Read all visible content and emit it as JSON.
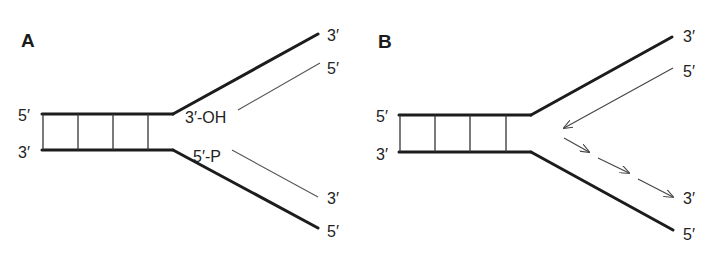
{
  "figure": {
    "panel_a": {
      "label": "A",
      "duplex_left_top": "5′",
      "duplex_left_bottom": "3′",
      "upper_parental_end": "3′",
      "upper_daughter_end": "5′",
      "lower_daughter_end": "3′",
      "lower_parental_end": "5′",
      "upper_fork_label": "3′-OH",
      "lower_fork_label": "5′-P"
    },
    "panel_b": {
      "label": "B",
      "duplex_left_top": "5′",
      "duplex_left_bottom": "3′",
      "upper_parental_end": "3′",
      "upper_daughter_end": "5′",
      "lower_daughter_end": "3′",
      "lower_parental_end": "5′"
    },
    "colors": {
      "strand": "#1c1c1c",
      "new_strand": "#555555",
      "background": "#ffffff"
    }
  }
}
